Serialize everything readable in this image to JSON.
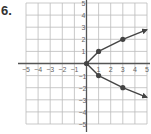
{
  "problem": {
    "number": "6."
  },
  "chart_data": {
    "type": "scatter",
    "title": "",
    "xlabel": "",
    "ylabel": "",
    "xlim": [
      -5,
      5
    ],
    "ylim": [
      -5,
      5
    ],
    "grid": true,
    "x_ticks": [
      -5,
      -4,
      -3,
      -2,
      -1,
      1,
      2,
      3,
      4,
      5
    ],
    "y_ticks": [
      5,
      4,
      3,
      2,
      1,
      -1,
      -2,
      -3,
      -4,
      -5
    ],
    "series": [
      {
        "name": "curve",
        "points": [
          [
            0,
            0
          ],
          [
            1,
            1
          ],
          [
            1,
            -1
          ],
          [
            3,
            2
          ],
          [
            3,
            -2
          ]
        ],
        "branches": [
          [
            [
              0,
              0
            ],
            [
              1,
              1
            ],
            [
              3,
              2
            ],
            [
              5,
              2.8
            ]
          ],
          [
            [
              0,
              0
            ],
            [
              1,
              -1
            ],
            [
              3,
              -2
            ],
            [
              5,
              -2.8
            ]
          ]
        ],
        "arrows": "both ends open to the right"
      }
    ],
    "colors": {
      "curve": "#444444",
      "grid": "#bbbbbb",
      "axis": "#555555"
    }
  }
}
